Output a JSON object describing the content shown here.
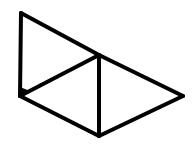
{
  "figure": {
    "type": "geometric-line-diagram",
    "stroke_color": "#000000",
    "background_color": "#ffffff",
    "vertices": {
      "A": [
        21,
        13
      ],
      "B": [
        20,
        96
      ],
      "C": [
        99,
        55
      ],
      "D": [
        99,
        136
      ],
      "E": [
        183,
        96
      ]
    },
    "edges": [
      [
        "A",
        "B"
      ],
      [
        "A",
        "C"
      ],
      [
        "C",
        "E"
      ],
      [
        "B",
        "C"
      ],
      [
        "C",
        "D"
      ],
      [
        "B",
        "D"
      ],
      [
        "D",
        "E"
      ]
    ],
    "right_angle_marker_at": "B"
  }
}
